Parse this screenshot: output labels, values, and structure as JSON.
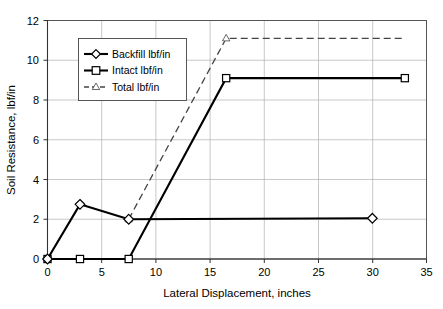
{
  "chart_data": {
    "type": "line",
    "title": "",
    "xlabel": "Lateral Displacement, inches",
    "ylabel": "Soil Resistance, lbf/in",
    "xlim": [
      0,
      35
    ],
    "ylim": [
      0,
      12
    ],
    "xticks": [
      0,
      5,
      10,
      15,
      20,
      25,
      30,
      35
    ],
    "yticks": [
      0,
      2,
      4,
      6,
      8,
      10,
      12
    ],
    "xtick_labels": [
      "0",
      "5",
      "10",
      "15",
      "20",
      "25",
      "30",
      "35"
    ],
    "ytick_labels": [
      "0",
      "2",
      "4",
      "6",
      "8",
      "10",
      "12"
    ],
    "grid": true,
    "legend_position": "upper-left-inside",
    "series": [
      {
        "name": "Backfill lbf/in",
        "marker": "diamond",
        "linestyle": "solid",
        "color": "#000000",
        "x": [
          0,
          3,
          7.5,
          30
        ],
        "y": [
          0,
          2.75,
          2.0,
          2.05
        ]
      },
      {
        "name": "Intact lbf/in",
        "marker": "square",
        "linestyle": "solid",
        "color": "#000000",
        "x": [
          0,
          3,
          7.5,
          16.5,
          33
        ],
        "y": [
          0,
          0,
          0,
          9.1,
          9.1
        ]
      },
      {
        "name": "Total lbf/in",
        "marker": "triangle",
        "linestyle": "dashed",
        "color": "#444444",
        "x": [
          7.5,
          16.5,
          33
        ],
        "y": [
          2.0,
          11.1,
          11.1
        ]
      }
    ],
    "legend_entries": [
      "Backfill lbf/in",
      "Intact lbf/in",
      "Total lbf/in"
    ]
  }
}
